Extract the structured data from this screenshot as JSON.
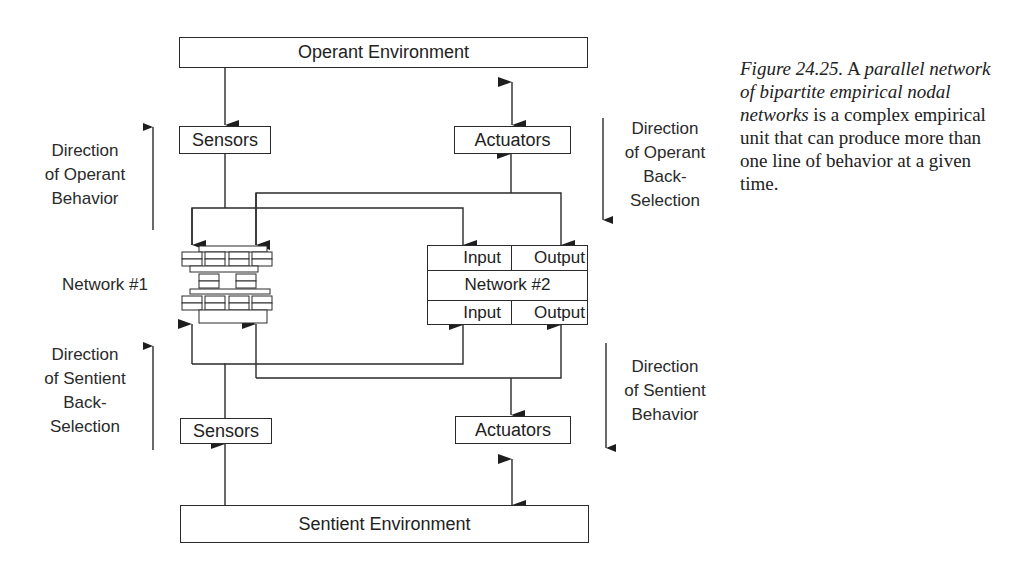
{
  "diagram": {
    "operant_environment": "Operant Environment",
    "sentient_environment": "Sentient Environment",
    "sensors_top": "Sensors",
    "actuators_top": "Actuators",
    "sensors_bottom": "Sensors",
    "actuators_bottom": "Actuators",
    "network1_label": "Network #1",
    "network2": {
      "title": "Network #2",
      "top_input": "Input",
      "top_output": "Output",
      "bottom_input": "Input",
      "bottom_output": "Output"
    },
    "directions": {
      "operant_behavior": [
        "Direction",
        "of Operant",
        "Behavior"
      ],
      "operant_back_selection": [
        "Direction",
        "of Operant",
        "Back-",
        "Selection"
      ],
      "sentient_back_selection": [
        "Direction",
        "of Sentient",
        "Back-",
        "Selection"
      ],
      "sentient_behavior": [
        "Direction",
        "of Sentient",
        "Behavior"
      ]
    }
  },
  "caption": {
    "figure_label": "Figure 24.25.",
    "lead": "A",
    "italic_phrase": "parallel network of bipartite empirical nodal networks",
    "rest": "is a complex empirical unit that can produce more than one line of behavior at a given time."
  }
}
